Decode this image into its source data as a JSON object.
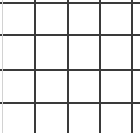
{
  "canvas": {
    "width": 140,
    "height": 133,
    "background_color": "#ffffff"
  },
  "grid": {
    "label": "4 by 4 square grid",
    "rows": 4,
    "columns": 4,
    "line_color": "#3a3a3a",
    "faint_line_color": "#d2d2d2",
    "line_thickness": 2,
    "bottom_border_visible": false,
    "vertical_lines": [
      {
        "name": "vertical-line-1",
        "x": 2,
        "color": "#d2d2d2",
        "thickness": 1
      },
      {
        "name": "vertical-line-2",
        "x": 34,
        "color": "#3a3a3a",
        "thickness": 2
      },
      {
        "name": "vertical-line-3",
        "x": 67,
        "color": "#3a3a3a",
        "thickness": 2
      },
      {
        "name": "vertical-line-4",
        "x": 99,
        "color": "#3a3a3a",
        "thickness": 2
      },
      {
        "name": "vertical-line-5",
        "x": 131,
        "color": "#3a3a3a",
        "thickness": 2
      }
    ],
    "horizontal_lines": [
      {
        "name": "horizontal-line-1",
        "y": 2,
        "color": "#3a3a3a",
        "thickness": 2
      },
      {
        "name": "horizontal-line-2",
        "y": 34,
        "color": "#3a3a3a",
        "thickness": 2
      },
      {
        "name": "horizontal-line-3",
        "y": 69,
        "color": "#3a3a3a",
        "thickness": 2
      },
      {
        "name": "horizontal-line-4",
        "y": 102,
        "color": "#3a3a3a",
        "thickness": 2
      }
    ],
    "cells": [
      {
        "name": "grid-cell-r1c1",
        "row": 1,
        "column": 1,
        "x": 4,
        "y": 4,
        "width": 30,
        "height": 30,
        "value": ""
      },
      {
        "name": "grid-cell-r1c2",
        "row": 1,
        "column": 2,
        "x": 36,
        "y": 4,
        "width": 31,
        "height": 30,
        "value": ""
      },
      {
        "name": "grid-cell-r1c3",
        "row": 1,
        "column": 3,
        "x": 69,
        "y": 4,
        "width": 30,
        "height": 30,
        "value": ""
      },
      {
        "name": "grid-cell-r1c4",
        "row": 1,
        "column": 4,
        "x": 101,
        "y": 4,
        "width": 30,
        "height": 30,
        "value": ""
      },
      {
        "name": "grid-cell-r2c1",
        "row": 2,
        "column": 1,
        "x": 4,
        "y": 36,
        "width": 30,
        "height": 33,
        "value": ""
      },
      {
        "name": "grid-cell-r2c2",
        "row": 2,
        "column": 2,
        "x": 36,
        "y": 36,
        "width": 31,
        "height": 33,
        "value": ""
      },
      {
        "name": "grid-cell-r2c3",
        "row": 2,
        "column": 3,
        "x": 69,
        "y": 36,
        "width": 30,
        "height": 33,
        "value": ""
      },
      {
        "name": "grid-cell-r2c4",
        "row": 2,
        "column": 4,
        "x": 101,
        "y": 36,
        "width": 30,
        "height": 33,
        "value": ""
      },
      {
        "name": "grid-cell-r3c1",
        "row": 3,
        "column": 1,
        "x": 4,
        "y": 71,
        "width": 30,
        "height": 31,
        "value": ""
      },
      {
        "name": "grid-cell-r3c2",
        "row": 3,
        "column": 2,
        "x": 36,
        "y": 71,
        "width": 31,
        "height": 31,
        "value": ""
      },
      {
        "name": "grid-cell-r3c3",
        "row": 3,
        "column": 3,
        "x": 69,
        "y": 71,
        "width": 30,
        "height": 31,
        "value": ""
      },
      {
        "name": "grid-cell-r3c4",
        "row": 3,
        "column": 4,
        "x": 101,
        "y": 71,
        "width": 30,
        "height": 31,
        "value": ""
      },
      {
        "name": "grid-cell-r4c1",
        "row": 4,
        "column": 1,
        "x": 4,
        "y": 104,
        "width": 30,
        "height": 29,
        "value": ""
      },
      {
        "name": "grid-cell-r4c2",
        "row": 4,
        "column": 2,
        "x": 36,
        "y": 104,
        "width": 31,
        "height": 29,
        "value": ""
      },
      {
        "name": "grid-cell-r4c3",
        "row": 4,
        "column": 3,
        "x": 69,
        "y": 104,
        "width": 30,
        "height": 29,
        "value": ""
      },
      {
        "name": "grid-cell-r4c4",
        "row": 4,
        "column": 4,
        "x": 101,
        "y": 104,
        "width": 30,
        "height": 29,
        "value": ""
      }
    ]
  }
}
